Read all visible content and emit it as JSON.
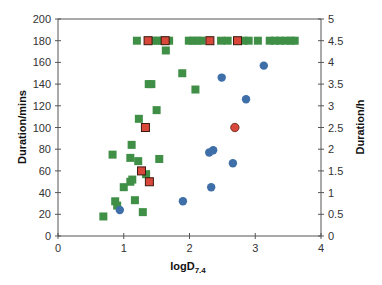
{
  "chart_data": {
    "type": "scatter",
    "title": "",
    "xlabel": "logD",
    "xlabel_subscript": "7.4",
    "ylabel": "Duration/mins",
    "y2label": "Duration/h",
    "xlim": [
      0,
      4
    ],
    "ylim": [
      0,
      200
    ],
    "y2lim": [
      0,
      5
    ],
    "grid": false,
    "legend": "none",
    "x_ticks": [
      "0",
      "1",
      "2",
      "3",
      "4"
    ],
    "y_ticks": [
      "0",
      "20",
      "40",
      "60",
      "80",
      "100",
      "120",
      "140",
      "160",
      "180",
      "200"
    ],
    "y2_ticks": [
      "0",
      "0.5",
      "1",
      "1.5",
      "2",
      "2.5",
      "3",
      "3.5",
      "4",
      "4.5",
      "5"
    ],
    "series": [
      {
        "name": "green squares",
        "marker": "square",
        "color": "#3f8f46",
        "points": [
          [
            0.69,
            18
          ],
          [
            0.87,
            32
          ],
          [
            0.9,
            28
          ],
          [
            1.0,
            45
          ],
          [
            1.1,
            50
          ],
          [
            1.13,
            52
          ],
          [
            1.17,
            33
          ],
          [
            1.29,
            22
          ],
          [
            1.34,
            57
          ],
          [
            0.83,
            75
          ],
          [
            1.1,
            72
          ],
          [
            1.22,
            69
          ],
          [
            1.54,
            71
          ],
          [
            1.12,
            84
          ],
          [
            1.23,
            108
          ],
          [
            1.5,
            116
          ],
          [
            1.38,
            140
          ],
          [
            1.42,
            140
          ],
          [
            2.09,
            135
          ],
          [
            1.89,
            150
          ],
          [
            1.64,
            171
          ],
          [
            1.2,
            180
          ],
          [
            1.45,
            180
          ],
          [
            1.52,
            180
          ],
          [
            1.58,
            180
          ],
          [
            1.69,
            180
          ],
          [
            1.99,
            180
          ],
          [
            2.05,
            180
          ],
          [
            2.12,
            180
          ],
          [
            2.18,
            180
          ],
          [
            2.48,
            180
          ],
          [
            2.58,
            180
          ],
          [
            2.82,
            180
          ],
          [
            2.9,
            180
          ],
          [
            3.04,
            180
          ],
          [
            3.22,
            180
          ],
          [
            3.3,
            180
          ],
          [
            3.38,
            180
          ],
          [
            3.46,
            180
          ],
          [
            3.54,
            180
          ],
          [
            3.6,
            180
          ]
        ]
      },
      {
        "name": "blue circles",
        "marker": "circle",
        "color": "#3e6fa8",
        "points": [
          [
            0.94,
            24
          ],
          [
            1.9,
            32
          ],
          [
            2.33,
            45
          ],
          [
            2.3,
            77
          ],
          [
            2.36,
            79
          ],
          [
            2.66,
            67
          ],
          [
            2.49,
            146
          ],
          [
            2.86,
            126
          ],
          [
            3.13,
            157
          ]
        ]
      },
      {
        "name": "red markers",
        "marker": "square-circle",
        "color": "#d9463a",
        "points": [
          [
            1.27,
            60
          ],
          [
            1.39,
            50
          ],
          [
            1.33,
            100
          ],
          [
            2.69,
            100
          ],
          [
            1.37,
            180
          ],
          [
            1.63,
            180
          ],
          [
            2.31,
            180
          ],
          [
            2.73,
            180
          ]
        ]
      }
    ]
  },
  "axes": {
    "xlabel": "logD",
    "xlabel_sub": "7.4",
    "ylabel": "Duration/mins",
    "y2label": "Duration/h"
  }
}
